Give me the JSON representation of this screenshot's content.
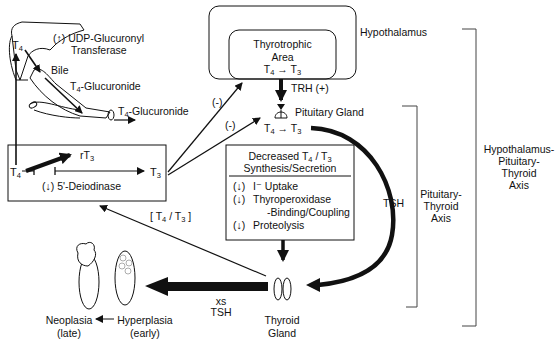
{
  "liver": {
    "t4_label": "T4",
    "enzyme_line1": "(↑) UDP-Glucuronyl",
    "enzyme_line2": "Transferase",
    "bile_label": "Bile",
    "bile_product": "T4-Glucuronide",
    "gut_product": "T4-Glucuronide"
  },
  "hypothalamus": {
    "label": "Hypothalamus",
    "inner_line1": "Thyrotrophic",
    "inner_line2": "Area",
    "inner_conversion": "T4 → T3",
    "trh_label": "TRH (+)"
  },
  "pituitary": {
    "label": "Pituitary Gland",
    "conversion": "T4 → T3",
    "feedback_to_hypothalamus": "(-)",
    "feedback_to_pituitary": "(-)"
  },
  "deiodinase_box": {
    "t4": "T4",
    "rt3": "rT3",
    "t3": "T3",
    "enzyme": "(↓) 5'-Deiodinase",
    "ratio_label": "[ T4 / T3 ]"
  },
  "thyroid_box": {
    "title_line1": "Decreased T4 / T3",
    "title_line2": "Synthesis/Secretion",
    "items": [
      {
        "arrow": "(↓)",
        "text": "I⁻ Uptake"
      },
      {
        "arrow": "(↓)",
        "text": "Thyroperoxidase"
      },
      {
        "arrow": "",
        "text": "-Binding/Coupling"
      },
      {
        "arrow": "(↓)",
        "text": "Proteolysis"
      }
    ]
  },
  "tsh": {
    "curve_label": "TSH",
    "excess_line1": "xs",
    "excess_line2": "TSH"
  },
  "thyroid": {
    "line1": "Thyroid",
    "line2": "Gland"
  },
  "outcomes": {
    "neoplasia_line1": "Neoplasia",
    "neoplasia_line2": "(late)",
    "hyperplasia_line1": "Hyperplasia",
    "hyperplasia_line2": "(early)"
  },
  "axes": {
    "pituitary_thyroid": [
      "Pituitary-",
      "Thyroid",
      "Axis"
    ],
    "hpt": [
      "Hypothalamus-",
      "Pituitary-",
      "Thyroid",
      "Axis"
    ]
  }
}
